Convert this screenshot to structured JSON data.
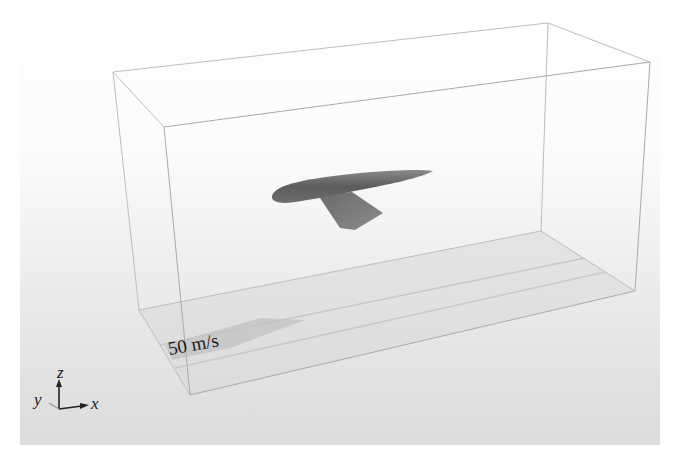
{
  "figure": {
    "type": "cfd-domain-render",
    "inflow_label": "50 m/s",
    "axes": {
      "x": "x",
      "y": "y",
      "z": "z"
    }
  },
  "colors": {
    "background_top": "#ffffff",
    "background_bottom": "#e2e2e2",
    "box_edges": "#b5b5b5",
    "floor_shadow": "#c4c4c4",
    "fuselage": "#6a6a6a",
    "wing": "#7a7a7a",
    "text": "#1a1a1a"
  }
}
